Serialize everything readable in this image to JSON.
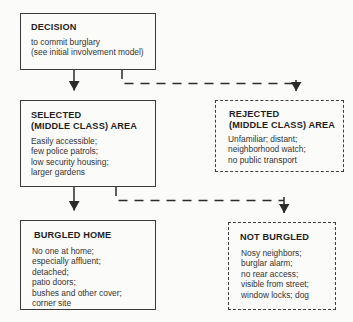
{
  "diagram": {
    "ink_color": "#2b2b2b",
    "background_color": "#fbfbfa"
  },
  "boxes": {
    "decision": {
      "title": "DECISION",
      "body": "to commit burglary\n(see initial involvement model)",
      "border_style": "solid"
    },
    "selected": {
      "title": "SELECTED\n(MIDDLE CLASS) AREA",
      "body": "Easily accessible;\nfew police patrols;\nlow security housing;\nlarger gardens",
      "border_style": "solid"
    },
    "rejected": {
      "title": "REJECTED\n(MIDDLE CLASS) AREA",
      "body": "Unfamiliar; distant;\nneighborhood watch;\nno public transport",
      "border_style": "dashed"
    },
    "burgled": {
      "title": "BURGLED HOME",
      "body": "No  one at home;\nespecially affluent;\ndetached;\npatio doors;\nbushes and other cover;\ncorner site",
      "border_style": "solid"
    },
    "not_burgled": {
      "title": "NOT BURGLED",
      "body": "Nosy neighbors;\nburglar alarm;\nno rear access;\nvisible from street;\nwindow locks; dog",
      "border_style": "dashed"
    }
  },
  "connectors": [
    {
      "name": "decision-to-selected",
      "from": "decision",
      "to": "selected",
      "line_style": "solid",
      "arrow": "filled-down"
    },
    {
      "name": "decision-to-rejected",
      "from": "decision",
      "to": "rejected",
      "line_style": "dashed",
      "arrow": "filled-down"
    },
    {
      "name": "selected-to-burgled",
      "from": "selected",
      "to": "burgled",
      "line_style": "solid",
      "arrow": "filled-down"
    },
    {
      "name": "selected-to-not-burgled",
      "from": "selected",
      "to": "not_burgled",
      "line_style": "dashed",
      "arrow": "filled-down"
    }
  ]
}
